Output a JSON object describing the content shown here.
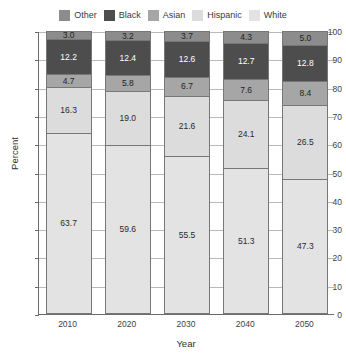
{
  "chart_data": {
    "type": "bar",
    "stacked": true,
    "title": "",
    "xlabel": "Year",
    "ylabel": "Percent",
    "categories": [
      "2010",
      "2020",
      "2030",
      "2040",
      "2050"
    ],
    "ylim": [
      0,
      100
    ],
    "yticks": [
      0,
      10,
      20,
      30,
      40,
      50,
      60,
      70,
      80,
      90,
      100
    ],
    "grid": true,
    "legend_position": "top",
    "series": [
      {
        "name": "White",
        "color": "#e3e3e3",
        "text_color": "#2a2a2a",
        "values": [
          63.7,
          59.6,
          55.5,
          51.3,
          47.3
        ],
        "labels": [
          "63.7",
          "59.6",
          "55.5",
          "51.3",
          "47.3"
        ]
      },
      {
        "name": "Hispanic",
        "color": "#dcdcdc",
        "text_color": "#2a2a2a",
        "values": [
          16.3,
          19.0,
          21.6,
          24.1,
          26.5
        ],
        "labels": [
          "16.3",
          "19.0",
          "21.6",
          "24.1",
          "26.5"
        ]
      },
      {
        "name": "Asian",
        "color": "#a6a6a6",
        "text_color": "#1f1f1f",
        "values": [
          4.7,
          5.8,
          6.7,
          7.6,
          8.4
        ],
        "labels": [
          "4.7",
          "5.8",
          "6.7",
          "7.6",
          "8.4"
        ]
      },
      {
        "name": "Black",
        "color": "#4d4d4d",
        "text_color": "#ffffff",
        "values": [
          12.2,
          12.4,
          12.6,
          12.7,
          12.8
        ],
        "labels": [
          "12.2",
          "12.4",
          "12.6",
          "12.7",
          "12.8"
        ]
      },
      {
        "name": "Other",
        "color": "#8c8c8c",
        "text_color": "#1f1f1f",
        "values": [
          3.0,
          3.2,
          3.7,
          4.3,
          5.0
        ],
        "labels": [
          "3.0",
          "3.2",
          "3.7",
          "4.3",
          "5.0"
        ]
      }
    ]
  },
  "legend": {
    "entries": [
      {
        "label": "Other",
        "color": "#8c8c8c"
      },
      {
        "label": "Black",
        "color": "#4d4d4d"
      },
      {
        "label": "Asian",
        "color": "#a6a6a6"
      },
      {
        "label": "Hispanic",
        "color": "#dcdcdc"
      },
      {
        "label": "White",
        "color": "#e3e3e3"
      }
    ]
  },
  "axes": {
    "y_title": "Percent",
    "x_title": "Year",
    "y_tick_labels": [
      "0",
      "10",
      "20",
      "30",
      "40",
      "50",
      "60",
      "70",
      "80",
      "90",
      "100"
    ],
    "x_tick_labels": [
      "2010",
      "2020",
      "2030",
      "2040",
      "2050"
    ]
  }
}
